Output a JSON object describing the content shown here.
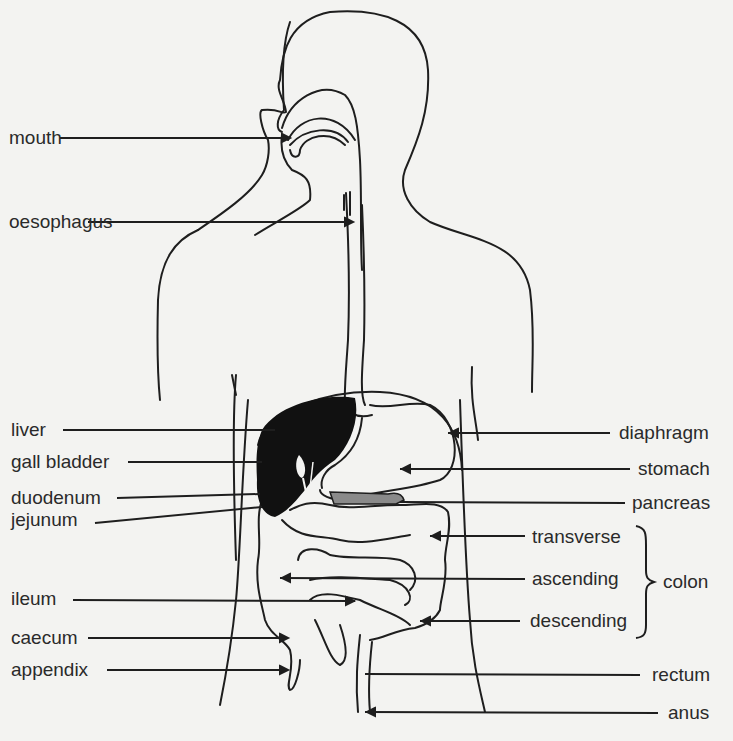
{
  "diagram": {
    "colors": {
      "background": "#f3f3f1",
      "line": "#1e1e1e",
      "liver": "#111111",
      "pancreas": "#8a8a8a"
    },
    "labels_left": [
      {
        "id": "mouth",
        "text": "mouth"
      },
      {
        "id": "oesophagus",
        "text": "oesophagus"
      },
      {
        "id": "liver",
        "text": "liver"
      },
      {
        "id": "gall_bladder",
        "text": "gall bladder"
      },
      {
        "id": "duodenum",
        "text": "duodenum"
      },
      {
        "id": "jejunum",
        "text": "jejunum"
      },
      {
        "id": "ileum",
        "text": "ileum"
      },
      {
        "id": "caecum",
        "text": "caecum"
      },
      {
        "id": "appendix",
        "text": "appendix"
      }
    ],
    "labels_right": [
      {
        "id": "diaphragm",
        "text": "diaphragm"
      },
      {
        "id": "stomach",
        "text": "stomach"
      },
      {
        "id": "pancreas",
        "text": "pancreas"
      },
      {
        "id": "transverse",
        "text": "transverse"
      },
      {
        "id": "ascending",
        "text": "ascending"
      },
      {
        "id": "descending",
        "text": "descending"
      },
      {
        "id": "rectum",
        "text": "rectum"
      },
      {
        "id": "anus",
        "text": "anus"
      }
    ],
    "group_label": {
      "text": "colon",
      "members": [
        "transverse",
        "ascending",
        "descending"
      ]
    }
  }
}
